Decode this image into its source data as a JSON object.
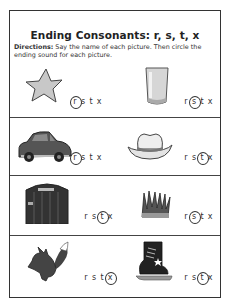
{
  "worksheet": {
    "title": "Ending Consonants: r, s, t, x",
    "directions_label": "Directions:",
    "directions_text": " Say the name of each picture. Then circle the ending sound for each picture.",
    "choice_letters": [
      "r",
      "s",
      "t",
      "x"
    ],
    "items": [
      {
        "picture": "star",
        "letters": [
          "r",
          "s",
          "t",
          "x"
        ],
        "circled": "r"
      },
      {
        "picture": "glass",
        "letters": [
          "r",
          "s",
          "t",
          "x"
        ],
        "circled": "s"
      },
      {
        "picture": "car",
        "letters": [
          "r",
          "s",
          "t",
          "x"
        ],
        "circled": "r"
      },
      {
        "picture": "hat",
        "letters": [
          "r",
          "s",
          "t",
          "x"
        ],
        "circled": "t"
      },
      {
        "picture": "gate",
        "letters": [
          "r",
          "s",
          "t",
          "x"
        ],
        "circled": "t"
      },
      {
        "picture": "grass",
        "letters": [
          "r",
          "s",
          "t",
          "x"
        ],
        "circled": "s"
      },
      {
        "picture": "fox",
        "letters": [
          "r",
          "s",
          "t",
          "x"
        ],
        "circled": "x"
      },
      {
        "picture": "skate",
        "letters": [
          "r",
          "s",
          "t",
          "x"
        ],
        "circled": "t"
      }
    ]
  }
}
